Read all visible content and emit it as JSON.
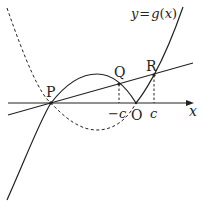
{
  "diagram": {
    "curve_label": "y = g(x)",
    "curve_label_parts": {
      "y": "y",
      "eq": "=",
      "g": "g",
      "lp": "(",
      "x": "x",
      "rp": ")"
    },
    "axis_label": "x",
    "points": {
      "P": "P",
      "Q": "Q",
      "R": "R",
      "O": "O"
    },
    "ticks": {
      "neg_c": "−c",
      "c": "c"
    },
    "colors": {
      "stroke": "#222222",
      "background": "#ffffff"
    }
  }
}
